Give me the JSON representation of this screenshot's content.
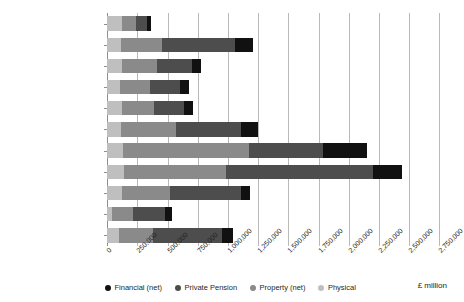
{
  "chart_data": {
    "type": "bar",
    "orientation": "horizontal",
    "stacked": true,
    "title": "",
    "subtitle": "",
    "xlabel": "£ million",
    "ylabel": "",
    "xlim": [
      0,
      2750000
    ],
    "grid": true,
    "legend_position": "bottom",
    "categories": [
      "North East",
      "North West",
      "Yorkshire & the Humber",
      "East Midlands",
      "West Midlands",
      "East of England",
      "London",
      "South East",
      "South West",
      "Wales",
      "Scotland"
    ],
    "xticks": [
      "0",
      "250,000",
      "500,000",
      "750,000",
      "1,000,000",
      "1,250,000",
      "1,500,000",
      "1,750,000",
      "2,000,000",
      "2,250,000",
      "2,500,000",
      "2,750,000"
    ],
    "xtick_values": [
      0,
      250000,
      500000,
      750000,
      1000000,
      1250000,
      1500000,
      1750000,
      2000000,
      2250000,
      2500000,
      2750000
    ],
    "series": [
      {
        "name": "Physical",
        "color": "#bfbfbf",
        "values": [
          120000,
          115000,
          120000,
          105000,
          120000,
          115000,
          130000,
          135000,
          120000,
          35000,
          100000
        ]
      },
      {
        "name": "Property (net)",
        "color": "#8a8a8a",
        "values": [
          115000,
          340000,
          290000,
          250000,
          265000,
          455000,
          1040000,
          850000,
          400000,
          175000,
          275000
        ]
      },
      {
        "name": "Private Pension",
        "color": "#4d4d4d",
        "values": [
          90000,
          600000,
          295000,
          245000,
          250000,
          540000,
          620000,
          1215000,
          590000,
          265000,
          575000
        ]
      },
      {
        "name": "Financial (net)",
        "color": "#111111",
        "values": [
          35000,
          150000,
          75000,
          75000,
          75000,
          140000,
          365000,
          245000,
          75000,
          60000,
          95000
        ]
      }
    ],
    "stack_order_left_to_right": [
      "Physical",
      "Property (net)",
      "Private Pension",
      "Financial (net)"
    ],
    "totals": [
      360000,
      1205000,
      780000,
      675000,
      710000,
      1250000,
      2155000,
      2445000,
      1185000,
      535000,
      1045000
    ]
  },
  "legend": {
    "items": [
      {
        "label": "Financial (net)",
        "color": "#111111",
        "icon": "circle-marker-icon"
      },
      {
        "label": "Private Pension",
        "color": "#4d4d4d",
        "icon": "circle-marker-icon"
      },
      {
        "label": "Property (net)",
        "color": "#8a8a8a",
        "icon": "circle-marker-icon"
      },
      {
        "label": "Physical",
        "color": "#bfbfbf",
        "icon": "circle-marker-icon"
      }
    ]
  }
}
